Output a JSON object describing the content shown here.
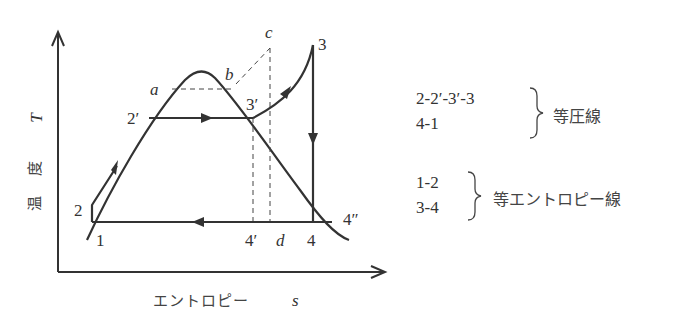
{
  "diagram": {
    "type": "T-s diagram (vapor compression / Rankine-type cycle)",
    "axes": {
      "y_label_jp": "温 度",
      "y_symbol": "T",
      "x_label_jp": "エントロピー",
      "x_symbol": "s"
    },
    "points": {
      "p1": "1",
      "p2": "2",
      "p2p": "2′",
      "p3": "3",
      "p3p": "3′",
      "p4": "4",
      "p4p": "4′",
      "p4pp": "4″",
      "a": "a",
      "b": "b",
      "c": "c",
      "d": "d"
    },
    "legend": {
      "group1": {
        "lines": [
          "2-2′-3′-3",
          "4-1"
        ],
        "label": "等圧線"
      },
      "group2": {
        "lines": [
          "1-2",
          "3-4"
        ],
        "label": "等エントロピー線"
      }
    }
  }
}
